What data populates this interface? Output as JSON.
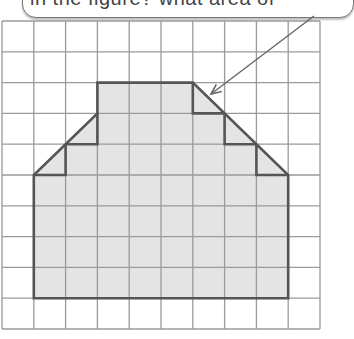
{
  "callout": {
    "text": "in the figure? what area of",
    "note": "text partially cropped at top edge"
  },
  "grid": {
    "columns": 10,
    "rows": 10,
    "origin_px": [
      2,
      21
    ],
    "cell_w_px": 31.8,
    "cell_h_px": 30.8,
    "line_color": "#9a9a9a"
  },
  "shape": {
    "fill_color": "#e4e4e4",
    "stroke_color": "#555555",
    "outline_grid_vertices": [
      [
        3,
        2
      ],
      [
        6,
        2
      ],
      [
        9,
        5
      ],
      [
        9,
        9
      ],
      [
        1,
        9
      ],
      [
        1,
        5
      ],
      [
        3,
        3
      ]
    ],
    "left_steps": [
      [
        [
          3,
          3
        ],
        [
          3,
          4
        ],
        [
          2,
          4
        ]
      ],
      [
        [
          2,
          4
        ],
        [
          2,
          5
        ],
        [
          1,
          5
        ]
      ]
    ],
    "right_steps": [
      [
        [
          6,
          2
        ],
        [
          6,
          3
        ],
        [
          7,
          3
        ]
      ],
      [
        [
          7,
          3
        ],
        [
          7,
          4
        ],
        [
          8,
          4
        ]
      ],
      [
        [
          8,
          4
        ],
        [
          8,
          5
        ],
        [
          9,
          5
        ]
      ]
    ],
    "full_squares": 38,
    "half_squares": 5
  },
  "arrow": {
    "from_px": [
      314,
      16
    ],
    "to_px": [
      211,
      94
    ],
    "color": "#666666"
  }
}
